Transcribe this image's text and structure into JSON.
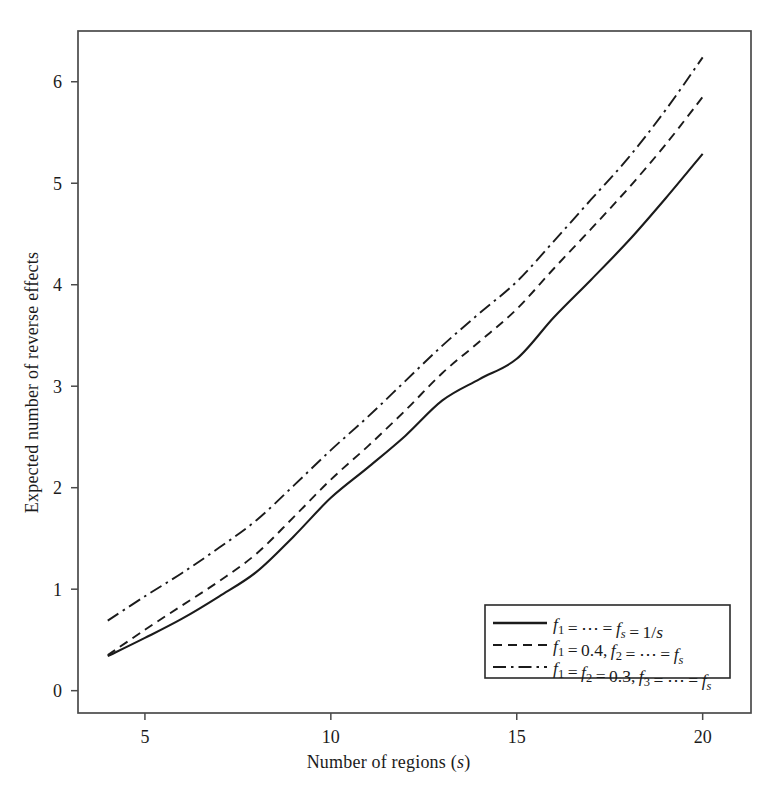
{
  "figure": {
    "background_color": "#ffffff",
    "line_color": "#1b1b1b",
    "frame_color": "#4a4a4a"
  },
  "axes": {
    "x_title": "Number of regions (s)",
    "x_title_plain": "Number of regions",
    "x_title_var": "s",
    "y_title": "Expected number of reverse effects",
    "x_ticks": [
      "5",
      "10",
      "15",
      "20"
    ],
    "y_ticks": [
      "0",
      "1",
      "2",
      "3",
      "4",
      "5",
      "6"
    ]
  },
  "legend": {
    "items": [
      {
        "style": "solid",
        "label": "f1 = ⋯ = fs = 1/s",
        "parts": [
          "f",
          "1",
          " = ⋯ = ",
          "f",
          "s",
          " = 1/",
          "s"
        ]
      },
      {
        "style": "dashed",
        "label": "f1 = 0.4, f2 = ⋯ = fs",
        "parts": [
          "f",
          "1",
          " = 0.4, ",
          "f",
          "2",
          " = ⋯ = ",
          "f",
          "s"
        ]
      },
      {
        "style": "dashdot",
        "label": "f1 = f2 = 0.3, f3 = ⋯ = fs",
        "parts": [
          "f",
          "1",
          " = ",
          "f",
          "2",
          " = 0.3, ",
          "f",
          "3",
          " = ⋯ = ",
          "f",
          "s"
        ]
      }
    ]
  },
  "chart_data": {
    "type": "line",
    "title": "",
    "xlabel": "Number of regions (s)",
    "ylabel": "Expected number of reverse effects",
    "xlim": [
      3.2,
      21.3
    ],
    "ylim": [
      -0.22,
      6.5
    ],
    "xticks": [
      5,
      10,
      15,
      20
    ],
    "yticks": [
      0,
      1,
      2,
      3,
      4,
      5,
      6
    ],
    "grid": false,
    "legend_position": "lower-right",
    "x": [
      4,
      5,
      6,
      7,
      8,
      9,
      10,
      11,
      12,
      13,
      14,
      15,
      16,
      17,
      18,
      19,
      20
    ],
    "series": [
      {
        "name": "f1 = ⋯ = fs = 1/s",
        "style": "solid",
        "values": [
          0.34,
          0.52,
          0.71,
          0.93,
          1.17,
          1.52,
          1.9,
          2.2,
          2.51,
          2.86,
          3.07,
          3.27,
          3.68,
          4.05,
          4.43,
          4.85,
          5.29
        ]
      },
      {
        "name": "f1 = 0.4, f2 = ⋯ = fs",
        "style": "dashed",
        "values": [
          0.35,
          0.6,
          0.84,
          1.08,
          1.35,
          1.71,
          2.08,
          2.41,
          2.76,
          3.13,
          3.44,
          3.76,
          4.16,
          4.55,
          4.95,
          5.38,
          5.85
        ]
      },
      {
        "name": "f1 = f2 = 0.3, f3 = ⋯ = fs",
        "style": "dashdot",
        "values": [
          0.69,
          0.93,
          1.16,
          1.41,
          1.68,
          2.02,
          2.37,
          2.7,
          3.05,
          3.4,
          3.72,
          4.03,
          4.43,
          4.84,
          5.25,
          5.72,
          6.24
        ]
      }
    ]
  }
}
